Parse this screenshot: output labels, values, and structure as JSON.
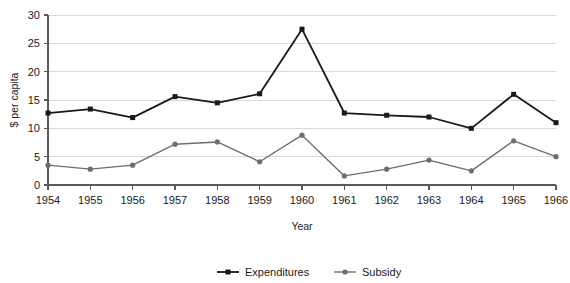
{
  "chart_data": {
    "type": "line",
    "title": "",
    "subtitle": "",
    "xlabel": "Year",
    "ylabel": "$ per capita",
    "categories": [
      "1954",
      "1955",
      "1956",
      "1957",
      "1958",
      "1959",
      "1960",
      "1961",
      "1962",
      "1963",
      "1964",
      "1965",
      "1966"
    ],
    "x": [
      1954,
      1955,
      1956,
      1957,
      1958,
      1959,
      1960,
      1961,
      1962,
      1963,
      1964,
      1965,
      1966
    ],
    "ylim": [
      0,
      30
    ],
    "yticks": [
      0,
      5,
      10,
      15,
      20,
      25,
      30
    ],
    "ytick_labels": [
      "0",
      "5",
      "10",
      "15",
      "20",
      "25",
      "30"
    ],
    "grid": "horizontal",
    "legend_position": "bottom-center",
    "series": [
      {
        "name": "Expenditures",
        "color": "#1a1a1a",
        "marker": "square",
        "values": [
          12.7,
          13.4,
          11.9,
          15.6,
          14.5,
          16.1,
          27.5,
          12.7,
          12.3,
          12.0,
          10.0,
          16.0,
          11.0
        ]
      },
      {
        "name": "Subsidy",
        "color": "#6e6e6e",
        "marker": "circle",
        "values": [
          3.5,
          2.8,
          3.5,
          7.2,
          7.6,
          4.1,
          8.8,
          1.6,
          2.8,
          4.4,
          2.5,
          7.8,
          5.0
        ]
      }
    ],
    "legend": [
      {
        "label": "Expenditures",
        "color": "#1a1a1a",
        "marker": "square"
      },
      {
        "label": "Subsidy",
        "color": "#6e6e6e",
        "marker": "circle"
      }
    ],
    "colors": {
      "expenditures": "#1a1a1a",
      "subsidy": "#6e6e6e",
      "gridline": "#d9d9d9",
      "axis": "#5a5a5a",
      "background": "#ffffff"
    }
  }
}
